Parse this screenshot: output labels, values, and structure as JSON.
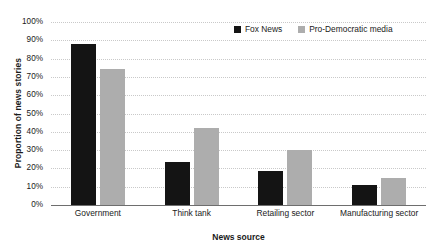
{
  "chart_data": {
    "type": "bar",
    "title": "",
    "subtitle": "",
    "xlabel": "News source",
    "ylabel": "Proportion of news stories",
    "categories": [
      "Government",
      "Think tank",
      "Retailing sector",
      "Manufacturing sector"
    ],
    "series": [
      {
        "name": "Fox News",
        "color": "#141414",
        "values": [
          88,
          23.5,
          18.5,
          11
        ]
      },
      {
        "name": "Pro-Democratic media",
        "color": "#adadad",
        "values": [
          74.5,
          42,
          30,
          15
        ]
      }
    ],
    "ylim": [
      0,
      100
    ],
    "ytick_values": [
      0,
      10,
      20,
      30,
      40,
      50,
      60,
      70,
      80,
      90,
      100
    ],
    "ytick_labels": [
      "0%",
      "10%",
      "20%",
      "30%",
      "40%",
      "50%",
      "60%",
      "70%",
      "80%",
      "90%",
      "100%"
    ],
    "grid": true,
    "grid_axis": "y",
    "grid_style": "dotted",
    "legend_position": "top-right",
    "orientation": "vertical",
    "bar_mode": "grouped"
  },
  "axes": {
    "y_title": "Proportion of news stories",
    "x_title": "News source"
  },
  "legend": {
    "entries": [
      {
        "label": "Fox News",
        "swatch": "legend-swatch-fox-news"
      },
      {
        "label": "Pro-Democratic media",
        "swatch": "legend-swatch-pro-democratic-media"
      }
    ]
  },
  "colors": {
    "series_fox_news": "#141414",
    "series_pro_democratic": "#adadad",
    "gridline": "#c9c9c9",
    "axis_line": "#6e6e6e",
    "text": "#1a1a1a",
    "background": "#ffffff"
  }
}
